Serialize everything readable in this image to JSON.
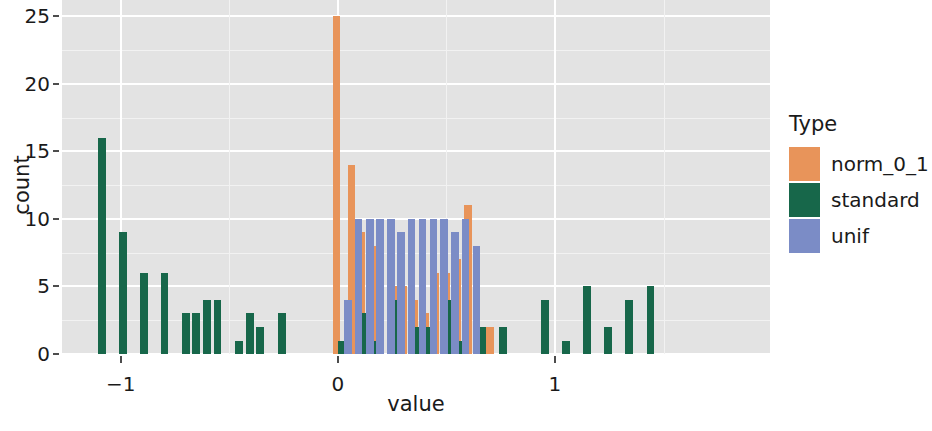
{
  "chart_data": {
    "type": "bar",
    "title": "",
    "subtitle": "",
    "xlabel": "value",
    "ylabel": "count",
    "xlim": [
      -1.27,
      1.99
    ],
    "ylim": [
      0,
      26.2
    ],
    "xticks": [
      -1,
      0,
      1
    ],
    "xticklabels": [
      "−1",
      "0",
      "1"
    ],
    "yticks": [
      0,
      5,
      10,
      15,
      20,
      25
    ],
    "yticklabels": [
      "0",
      "5",
      "10",
      "15",
      "20",
      "25"
    ],
    "grid": true,
    "grid_major_y": [
      0,
      5,
      10,
      15,
      20,
      25
    ],
    "grid_minor_y": [
      2.5,
      7.5,
      12.5,
      17.5,
      22.5
    ],
    "grid_major_x": [
      -1,
      0,
      1
    ],
    "grid_minor_x": [
      -0.5,
      0.5,
      1.5
    ],
    "legend": {
      "title": "Type",
      "position": "right",
      "entries": [
        {
          "name": "norm_0_1",
          "color": "#E8945A"
        },
        {
          "name": "standard",
          "color": "#17674A"
        },
        {
          "name": "unif",
          "color": "#7B8CC6"
        }
      ]
    },
    "panel_background": "#E3E3E3",
    "series": [
      {
        "name": "norm_0_1",
        "color": "#E8945A",
        "points": [
          {
            "x": -0.005,
            "y": 25
          },
          {
            "x": 0.062,
            "y": 14
          },
          {
            "x": 0.108,
            "y": 9
          },
          {
            "x": 0.16,
            "y": 8
          },
          {
            "x": 0.256,
            "y": 5
          },
          {
            "x": 0.3,
            "y": 5
          },
          {
            "x": 0.352,
            "y": 4
          },
          {
            "x": 0.404,
            "y": 3
          },
          {
            "x": 0.45,
            "y": 6
          },
          {
            "x": 0.5,
            "y": 6
          },
          {
            "x": 0.552,
            "y": 7
          },
          {
            "x": 0.6,
            "y": 11
          },
          {
            "x": 0.7,
            "y": 2
          }
        ]
      },
      {
        "name": "standard",
        "color": "#17674A",
        "points": [
          {
            "x": -1.085,
            "y": 16
          },
          {
            "x": -0.99,
            "y": 9
          },
          {
            "x": -0.892,
            "y": 6
          },
          {
            "x": -0.797,
            "y": 6
          },
          {
            "x": -0.7,
            "y": 3
          },
          {
            "x": -0.652,
            "y": 3
          },
          {
            "x": -0.602,
            "y": 4
          },
          {
            "x": -0.555,
            "y": 4
          },
          {
            "x": -0.455,
            "y": 1
          },
          {
            "x": -0.405,
            "y": 3
          },
          {
            "x": -0.358,
            "y": 2
          },
          {
            "x": -0.258,
            "y": 3
          },
          {
            "x": 0.02,
            "y": 1
          },
          {
            "x": 0.122,
            "y": 3
          },
          {
            "x": 0.175,
            "y": 1
          },
          {
            "x": 0.27,
            "y": 4
          },
          {
            "x": 0.37,
            "y": 2
          },
          {
            "x": 0.418,
            "y": 2
          },
          {
            "x": 0.52,
            "y": 4
          },
          {
            "x": 0.565,
            "y": 1
          },
          {
            "x": 0.665,
            "y": 2
          },
          {
            "x": 0.76,
            "y": 2
          },
          {
            "x": 0.955,
            "y": 4
          },
          {
            "x": 1.05,
            "y": 1
          },
          {
            "x": 1.148,
            "y": 5
          },
          {
            "x": 1.245,
            "y": 2
          },
          {
            "x": 1.34,
            "y": 4
          },
          {
            "x": 1.44,
            "y": 5
          }
        ]
      },
      {
        "name": "unif",
        "color": "#7B8CC6",
        "points": [
          {
            "x": 0.048,
            "y": 4
          },
          {
            "x": 0.095,
            "y": 10
          },
          {
            "x": 0.148,
            "y": 10
          },
          {
            "x": 0.195,
            "y": 10
          },
          {
            "x": 0.245,
            "y": 10
          },
          {
            "x": 0.292,
            "y": 9
          },
          {
            "x": 0.34,
            "y": 10
          },
          {
            "x": 0.39,
            "y": 10
          },
          {
            "x": 0.44,
            "y": 10
          },
          {
            "x": 0.49,
            "y": 10
          },
          {
            "x": 0.54,
            "y": 9
          },
          {
            "x": 0.588,
            "y": 10
          },
          {
            "x": 0.638,
            "y": 8
          }
        ]
      }
    ]
  }
}
